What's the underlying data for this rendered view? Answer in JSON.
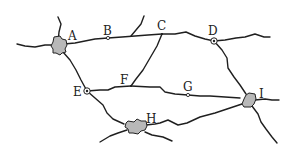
{
  "map": {
    "type": "road-network",
    "colors": {
      "road": "#1f1f1f",
      "town_fill": "#b8b8b8",
      "background": "#ffffff"
    },
    "places": [
      {
        "id": "A",
        "label": "A",
        "kind": "town",
        "x": 58,
        "y": 45,
        "label_x": 68,
        "label_y": 30
      },
      {
        "id": "B",
        "label": "B",
        "kind": "small-node",
        "x": 108,
        "y": 38,
        "label_x": 103,
        "label_y": 25
      },
      {
        "id": "C",
        "label": "C",
        "kind": "junction",
        "x": 162,
        "y": 34,
        "label_x": 157,
        "label_y": 20
      },
      {
        "id": "D",
        "label": "D",
        "kind": "ringed-node",
        "x": 214,
        "y": 41,
        "label_x": 208,
        "label_y": 25
      },
      {
        "id": "E",
        "label": "E",
        "kind": "ringed-node",
        "x": 87,
        "y": 91,
        "label_x": 73,
        "label_y": 86
      },
      {
        "id": "F",
        "label": "F",
        "kind": "junction",
        "x": 131,
        "y": 86,
        "label_x": 120,
        "label_y": 74
      },
      {
        "id": "G",
        "label": "G",
        "kind": "small-node",
        "x": 188,
        "y": 95,
        "label_x": 183,
        "label_y": 81
      },
      {
        "id": "H",
        "label": "H",
        "kind": "town",
        "x": 135,
        "y": 127,
        "label_x": 146,
        "label_y": 113
      },
      {
        "id": "I",
        "label": "I",
        "kind": "town",
        "x": 248,
        "y": 100,
        "label_x": 259,
        "label_y": 88
      }
    ],
    "roads": [
      {
        "from": "A",
        "to": "B"
      },
      {
        "from": "B",
        "to": "C"
      },
      {
        "from": "C",
        "to": "D"
      },
      {
        "from": "C",
        "to": "F"
      },
      {
        "from": "A",
        "to": "E"
      },
      {
        "from": "E",
        "to": "F"
      },
      {
        "from": "F",
        "to": "G"
      },
      {
        "from": "G",
        "to": "I"
      },
      {
        "from": "D",
        "to": "I"
      },
      {
        "from": "E",
        "to": "H"
      },
      {
        "from": "H",
        "to": "I"
      }
    ]
  }
}
